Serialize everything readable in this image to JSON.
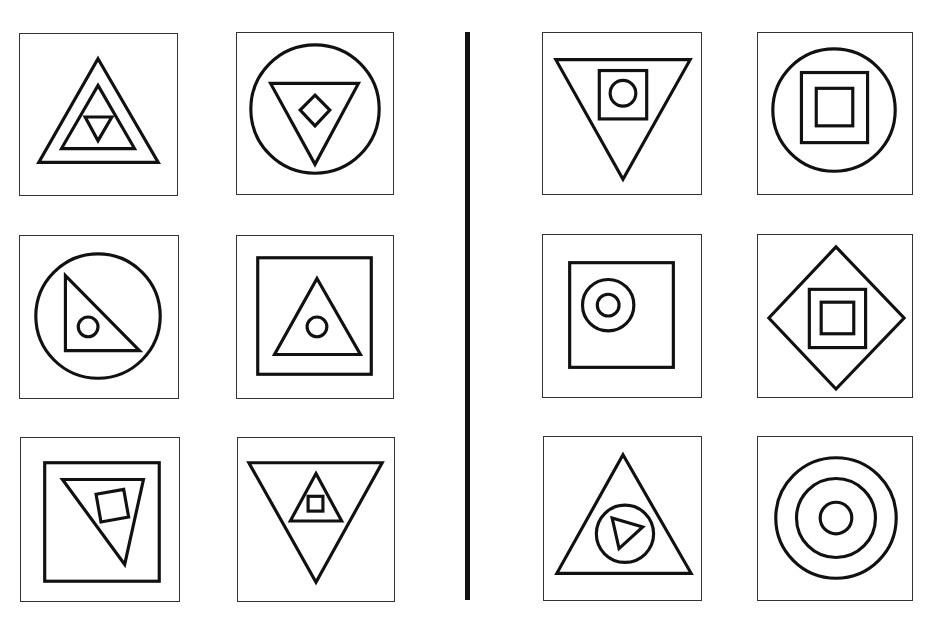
{
  "figure": {
    "divider": {
      "color": "#111111"
    },
    "groups": [
      {
        "side": "left",
        "panels": [
          {
            "id": "L1",
            "row": 1,
            "col": 1,
            "content": "upward triangle containing upward triangle containing small downward triangle"
          },
          {
            "id": "L2",
            "row": 1,
            "col": 2,
            "content": "circle containing downward triangle containing diamond"
          },
          {
            "id": "L3",
            "row": 2,
            "col": 1,
            "content": "circle containing right triangle containing small circle"
          },
          {
            "id": "L4",
            "row": 2,
            "col": 2,
            "content": "square containing upward triangle containing small circle"
          },
          {
            "id": "L5",
            "row": 3,
            "col": 1,
            "content": "square containing tilted downward triangle containing tilted square"
          },
          {
            "id": "L6",
            "row": 3,
            "col": 2,
            "content": "downward triangle containing upward triangle containing small square"
          }
        ]
      },
      {
        "side": "right",
        "panels": [
          {
            "id": "R1",
            "row": 1,
            "col": 1,
            "content": "downward triangle containing square containing circle"
          },
          {
            "id": "R2",
            "row": 1,
            "col": 2,
            "content": "circle containing square containing square"
          },
          {
            "id": "R3",
            "row": 2,
            "col": 1,
            "content": "square containing circle containing circle (off-center)"
          },
          {
            "id": "R4",
            "row": 2,
            "col": 2,
            "content": "diamond containing square containing square"
          },
          {
            "id": "R5",
            "row": 3,
            "col": 1,
            "content": "upward triangle containing circle containing right-pointing triangle"
          },
          {
            "id": "R6",
            "row": 3,
            "col": 2,
            "content": "three concentric circles"
          }
        ]
      }
    ]
  }
}
